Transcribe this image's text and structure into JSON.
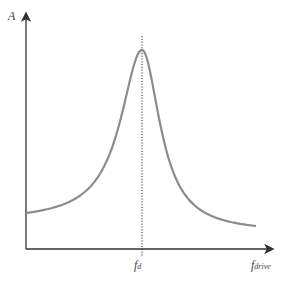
{
  "chart_data": {
    "type": "line",
    "title": "",
    "xlabel": "f_drive",
    "ylabel": "A",
    "grid": false,
    "legend": null,
    "annotations": [
      {
        "type": "vertical-dotted-line",
        "x_label": "f_d",
        "position": "resonance peak"
      }
    ],
    "series": [
      {
        "name": "amplitude",
        "color": "#8a8a8a",
        "x": [
          0.0,
          0.1,
          0.2,
          0.3,
          0.4,
          0.5,
          0.6,
          0.7,
          0.8,
          0.85,
          0.9,
          0.95,
          1.0,
          1.05,
          1.1,
          1.15,
          1.2,
          1.3,
          1.4,
          1.5,
          1.6,
          1.7,
          1.8,
          1.9,
          2.0
        ],
        "note": "resonance curve: low baseline at left, sharp peak at f_d, decaying tail on right lower than left start"
      }
    ],
    "peak": {
      "x_label": "f_d"
    }
  },
  "labels": {
    "y_axis": "A",
    "x_axis_main": "f",
    "x_axis_sub": "drive",
    "fd_main": "f",
    "fd_sub": "d"
  },
  "geometry": {
    "x0": 26,
    "x_end": 256,
    "axis_y": 249,
    "peak_x": 142,
    "peak_y": 50,
    "left_y": 213,
    "right_y": 226
  }
}
